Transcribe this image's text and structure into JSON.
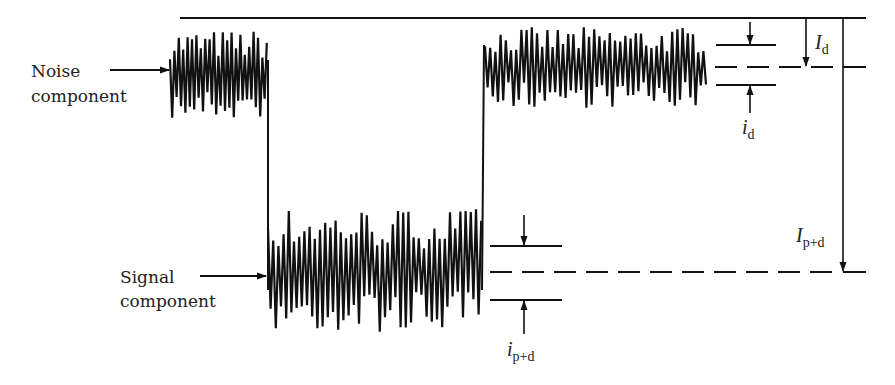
{
  "labels": {
    "noise_line1": "Noise",
    "noise_line2": "component",
    "signal_line1": "Signal",
    "signal_line2": "component"
  },
  "symbols": {
    "I_d": {
      "main": "I",
      "sub": "d"
    },
    "i_d": {
      "main": "i",
      "sub": "d"
    },
    "I_pd": {
      "main": "I",
      "sub": "p+d"
    },
    "i_pd": {
      "main": "i",
      "sub": "p+d"
    }
  },
  "colors": {
    "stroke": "#111111",
    "background": "#ffffff"
  },
  "geometry": {
    "reference_line_y": 18,
    "noise_mean_y": 67,
    "signal_mean_y": 272,
    "noise_block_1": {
      "x0": 170,
      "x1": 268,
      "top": 30,
      "bottom": 120
    },
    "signal_block": {
      "x0": 268,
      "x1": 482,
      "top": 208,
      "bottom": 332
    },
    "noise_block_2": {
      "x0": 485,
      "x1": 708,
      "top": 27,
      "bottom": 108
    }
  }
}
